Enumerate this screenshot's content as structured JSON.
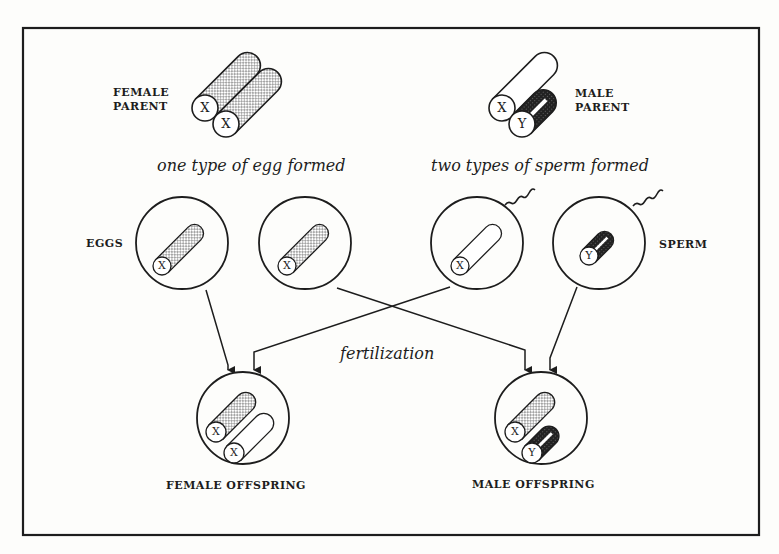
{
  "diagram": {
    "parents": {
      "female": {
        "label_line1": "FEMALE",
        "label_line2": "PARENT",
        "chromosomes": [
          "X",
          "X"
        ]
      },
      "male": {
        "label_line1": "MALE",
        "label_line2": "PARENT",
        "chromosomes": [
          "X",
          "Y"
        ]
      }
    },
    "captions": {
      "eggs": "one type of egg formed",
      "sperm": "two types of sperm formed",
      "fertilization": "fertilization"
    },
    "gametes": {
      "eggs_label": "EGGS",
      "sperm_label": "SPERM",
      "egg1": "X",
      "egg2": "X",
      "sperm1": "X",
      "sperm2": "Y"
    },
    "offspring": {
      "female": {
        "label": "FEMALE OFFSPRING",
        "chromosomes": [
          "X",
          "X"
        ]
      },
      "male": {
        "label": "MALE OFFSPRING",
        "chromosomes": [
          "X",
          "Y"
        ]
      }
    },
    "colors": {
      "ink": "#1d1d1d",
      "paper": "#fdfdfb"
    }
  }
}
